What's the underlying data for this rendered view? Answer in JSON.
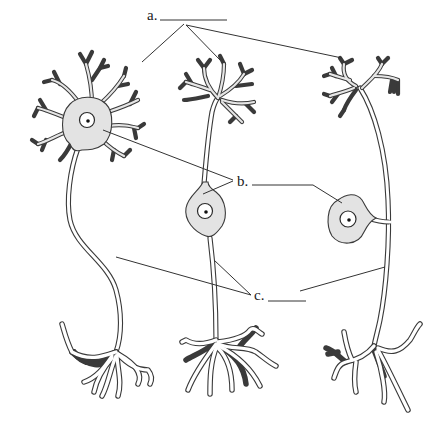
{
  "diagram": {
    "labels": [
      {
        "id": "a",
        "text": "a.",
        "blank": "",
        "target": "dendrites"
      },
      {
        "id": "b",
        "text": "b.",
        "blank": "",
        "target": "cell body"
      },
      {
        "id": "c",
        "text": "c.",
        "blank": "",
        "target": "axon"
      }
    ],
    "neurons": [
      {
        "name": "multipolar-neuron",
        "position": "left"
      },
      {
        "name": "bipolar-neuron",
        "position": "center"
      },
      {
        "name": "unipolar-neuron",
        "position": "right"
      }
    ],
    "colors": {
      "soma_fill": "#e3e3e3",
      "outline": "#3a3a3a",
      "background": "#ffffff",
      "nucleolus": "#111111"
    }
  }
}
